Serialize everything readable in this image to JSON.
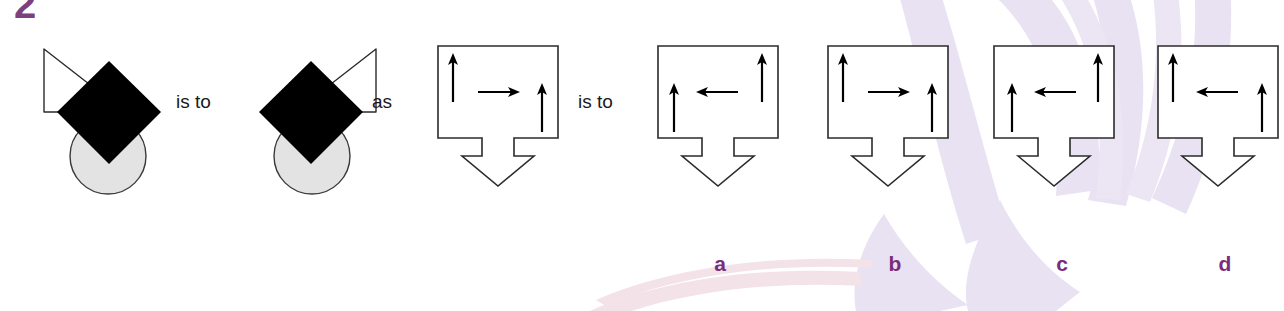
{
  "question": {
    "number": "2",
    "type": "visual-analogy"
  },
  "connectives": {
    "is_to_first": "is to",
    "as": "as",
    "is_to_second": "is to"
  },
  "colors": {
    "ink": "#1a1a1a",
    "label_purple": "#7b2d7b",
    "number_purple": "#7d3f7d",
    "circle_fill": "#e2e2e2",
    "watermark_lavender": "#e8e0f0",
    "watermark_pink": "#f5dde3",
    "paper": "#ffffff"
  },
  "shape_figures": [
    {
      "name": "figure-left",
      "triangle_side": "upper-left",
      "diamond": "black-filled",
      "circle": "light-gray-filled"
    },
    {
      "name": "figure-right",
      "triangle_side": "upper-right",
      "diamond": "black-filled",
      "circle": "light-gray-filled"
    }
  ],
  "box_figures": [
    {
      "name": "box-source",
      "role": "source",
      "label": "",
      "left_arrow": {
        "direction": "up",
        "vertical_position": "high"
      },
      "middle_arrow": {
        "direction": "right",
        "vertical_position": "middle"
      },
      "right_arrow": {
        "direction": "up",
        "vertical_position": "low"
      },
      "bottom_arrow": "down"
    },
    {
      "name": "box-option-a",
      "role": "option",
      "label": "a",
      "left_arrow": {
        "direction": "up",
        "vertical_position": "low"
      },
      "middle_arrow": {
        "direction": "left",
        "vertical_position": "middle"
      },
      "right_arrow": {
        "direction": "up",
        "vertical_position": "high"
      },
      "bottom_arrow": "down"
    },
    {
      "name": "box-option-b",
      "role": "option",
      "label": "b",
      "left_arrow": {
        "direction": "up",
        "vertical_position": "high"
      },
      "middle_arrow": {
        "direction": "right",
        "vertical_position": "middle"
      },
      "right_arrow": {
        "direction": "up",
        "vertical_position": "low"
      },
      "bottom_arrow": "down"
    },
    {
      "name": "box-option-c",
      "role": "option",
      "label": "c",
      "left_arrow": {
        "direction": "up",
        "vertical_position": "low"
      },
      "middle_arrow": {
        "direction": "left",
        "vertical_position": "middle"
      },
      "right_arrow": {
        "direction": "up",
        "vertical_position": "high"
      },
      "bottom_arrow": "down"
    },
    {
      "name": "box-option-d",
      "role": "option",
      "label": "d",
      "left_arrow": {
        "direction": "up",
        "vertical_position": "high"
      },
      "middle_arrow": {
        "direction": "left",
        "vertical_position": "middle"
      },
      "right_arrow": {
        "direction": "up",
        "vertical_position": "low"
      },
      "bottom_arrow": "down"
    }
  ],
  "option_labels": {
    "a": "a",
    "b": "b",
    "c": "c",
    "d": "d"
  }
}
